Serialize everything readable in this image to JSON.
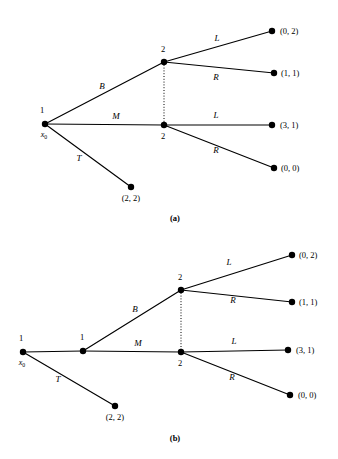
{
  "figure": {
    "panels": [
      {
        "id": "a",
        "caption": "(a)",
        "caption_pos": {
          "x": 175,
          "y": 221
        },
        "nodes": [
          {
            "name": "root",
            "x": 45,
            "y": 124,
            "r": 3.2,
            "player": "1",
            "player_pos": {
              "x": 42,
              "y": 113
            },
            "root_name": "x",
            "root_sub": "0",
            "root_pos": {
              "x": 44,
              "y": 137
            }
          },
          {
            "name": "p2-upper",
            "x": 164,
            "y": 62,
            "r": 3.2,
            "player": "2",
            "player_pos": {
              "x": 163,
              "y": 52
            }
          },
          {
            "name": "p2-lower",
            "x": 164,
            "y": 125,
            "r": 3.2,
            "player": "2",
            "player_pos": {
              "x": 163,
              "y": 139
            }
          },
          {
            "name": "terminal-02",
            "x": 272,
            "y": 31,
            "r": 3.2
          },
          {
            "name": "terminal-11",
            "x": 274,
            "y": 73,
            "r": 3.2
          },
          {
            "name": "terminal-31",
            "x": 272,
            "y": 125,
            "r": 3.2
          },
          {
            "name": "terminal-00",
            "x": 274,
            "y": 168,
            "r": 3.2
          },
          {
            "name": "terminal-22",
            "x": 131,
            "y": 187,
            "r": 3.2
          }
        ],
        "edges": [
          {
            "name": "edge-B",
            "x1": 45,
            "y1": 124,
            "x2": 164,
            "y2": 62
          },
          {
            "name": "edge-M",
            "x1": 45,
            "y1": 124,
            "x2": 164,
            "y2": 125
          },
          {
            "name": "edge-T",
            "x1": 45,
            "y1": 124,
            "x2": 131,
            "y2": 187
          },
          {
            "name": "edge-upper-L",
            "x1": 164,
            "y1": 62,
            "x2": 272,
            "y2": 31
          },
          {
            "name": "edge-upper-R",
            "x1": 164,
            "y1": 62,
            "x2": 274,
            "y2": 73
          },
          {
            "name": "edge-lower-L",
            "x1": 164,
            "y1": 125,
            "x2": 272,
            "y2": 125
          },
          {
            "name": "edge-lower-R",
            "x1": 164,
            "y1": 125,
            "x2": 274,
            "y2": 168
          }
        ],
        "info_set": {
          "name": "information-set-connector",
          "x1": 164,
          "y1": 62,
          "x2": 164,
          "y2": 125
        },
        "actions": [
          {
            "name": "action-label-B",
            "text": "B",
            "x": 102,
            "y": 89
          },
          {
            "name": "action-label-M",
            "text": "M",
            "x": 116,
            "y": 119
          },
          {
            "name": "action-label-T",
            "text": "T",
            "x": 79,
            "y": 161
          },
          {
            "name": "action-label-L-upper",
            "text": "L",
            "x": 217,
            "y": 41
          },
          {
            "name": "action-label-R-upper",
            "text": "R",
            "x": 216,
            "y": 80
          },
          {
            "name": "action-label-L-lower",
            "text": "L",
            "x": 216,
            "y": 118
          },
          {
            "name": "action-label-R-lower",
            "text": "R",
            "x": 216,
            "y": 153
          }
        ],
        "payoffs": [
          {
            "name": "payoff-0-2",
            "text": "(0, 2)",
            "x": 280,
            "y": 34,
            "below": false
          },
          {
            "name": "payoff-1-1",
            "text": "(1, 1)",
            "x": 281,
            "y": 76,
            "below": false
          },
          {
            "name": "payoff-3-1",
            "text": "(3, 1)",
            "x": 280,
            "y": 128,
            "below": false
          },
          {
            "name": "payoff-0-0",
            "text": "(0, 0)",
            "x": 281,
            "y": 171,
            "below": false
          },
          {
            "name": "payoff-2-2",
            "text": "(2, 2)",
            "x": 131,
            "y": 201,
            "below": true
          }
        ]
      },
      {
        "id": "b",
        "caption": "(b)",
        "caption_pos": {
          "x": 175,
          "y": 211
        },
        "nodes": [
          {
            "name": "root",
            "x": 23,
            "y": 122,
            "r": 3.2,
            "player": "1",
            "player_pos": {
              "x": 21,
              "y": 111
            },
            "root_name": "x",
            "root_sub": "0",
            "root_pos": {
              "x": 22,
              "y": 135
            }
          },
          {
            "name": "p1-second",
            "x": 83,
            "y": 121,
            "r": 3.2,
            "player": "1",
            "player_pos": {
              "x": 82,
              "y": 110
            }
          },
          {
            "name": "p2-upper",
            "x": 181,
            "y": 60,
            "r": 3.2,
            "player": "2",
            "player_pos": {
              "x": 180,
              "y": 50
            }
          },
          {
            "name": "p2-lower",
            "x": 181,
            "y": 122,
            "r": 3.2,
            "player": "2",
            "player_pos": {
              "x": 180,
              "y": 136
            }
          },
          {
            "name": "terminal-02",
            "x": 292,
            "y": 25,
            "r": 3.2
          },
          {
            "name": "terminal-11",
            "x": 292,
            "y": 72,
            "r": 3.2
          },
          {
            "name": "terminal-31",
            "x": 288,
            "y": 120,
            "r": 3.2
          },
          {
            "name": "terminal-00",
            "x": 290,
            "y": 165,
            "r": 3.2
          },
          {
            "name": "terminal-22",
            "x": 115,
            "y": 176,
            "r": 3.2
          }
        ],
        "edges": [
          {
            "name": "edge-root-to-p1",
            "x1": 23,
            "y1": 122,
            "x2": 83,
            "y2": 121
          },
          {
            "name": "edge-B",
            "x1": 83,
            "y1": 121,
            "x2": 181,
            "y2": 60
          },
          {
            "name": "edge-M",
            "x1": 83,
            "y1": 121,
            "x2": 181,
            "y2": 122
          },
          {
            "name": "edge-T",
            "x1": 23,
            "y1": 122,
            "x2": 115,
            "y2": 176
          },
          {
            "name": "edge-upper-L",
            "x1": 181,
            "y1": 60,
            "x2": 292,
            "y2": 25
          },
          {
            "name": "edge-upper-R",
            "x1": 181,
            "y1": 60,
            "x2": 292,
            "y2": 72
          },
          {
            "name": "edge-lower-L",
            "x1": 181,
            "y1": 122,
            "x2": 288,
            "y2": 120
          },
          {
            "name": "edge-lower-R",
            "x1": 181,
            "y1": 122,
            "x2": 290,
            "y2": 165
          }
        ],
        "info_set": {
          "name": "information-set-connector",
          "x1": 181,
          "y1": 60,
          "x2": 181,
          "y2": 122
        },
        "actions": [
          {
            "name": "action-label-B",
            "text": "B",
            "x": 135,
            "y": 82
          },
          {
            "name": "action-label-M",
            "text": "M",
            "x": 138,
            "y": 116
          },
          {
            "name": "action-label-T",
            "text": "T",
            "x": 58,
            "y": 152
          },
          {
            "name": "action-label-L-upper",
            "text": "L",
            "x": 229,
            "y": 35
          },
          {
            "name": "action-label-R-upper",
            "text": "R",
            "x": 233,
            "y": 73
          },
          {
            "name": "action-label-L-lower",
            "text": "L",
            "x": 234,
            "y": 114
          },
          {
            "name": "action-label-R-lower",
            "text": "R",
            "x": 232,
            "y": 150
          }
        ],
        "payoffs": [
          {
            "name": "payoff-0-2",
            "text": "(0, 2)",
            "x": 299,
            "y": 28,
            "below": false
          },
          {
            "name": "payoff-1-1",
            "text": "(1, 1)",
            "x": 299,
            "y": 75,
            "below": false
          },
          {
            "name": "payoff-3-1",
            "text": "(3, 1)",
            "x": 296,
            "y": 123,
            "below": false
          },
          {
            "name": "payoff-0-0",
            "text": "(0, 0)",
            "x": 298,
            "y": 168,
            "below": false
          },
          {
            "name": "payoff-2-2",
            "text": "(2, 2)",
            "x": 115,
            "y": 190,
            "below": true
          }
        ]
      }
    ]
  }
}
